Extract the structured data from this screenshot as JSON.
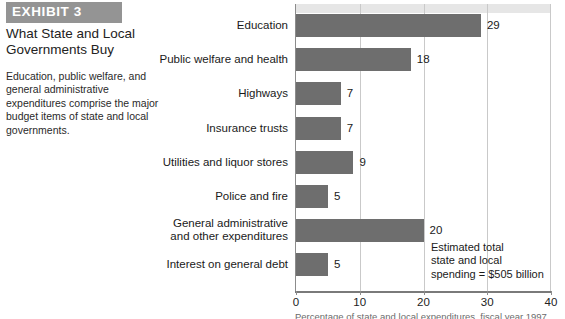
{
  "exhibit": {
    "banner_label": "EXHIBIT 3",
    "title": "What State and Local\nGovernments Buy",
    "description": "Education, public welfare, and general administrative expenditures comprise the major budget items of state and local governments."
  },
  "annotation": "Estimated total\nstate and local\nspending = $505 billion",
  "source_caption": "Percentage of state and local expenditures, fiscal year 1997",
  "colors": {
    "banner": "#949494",
    "bar_fill": "#6e6e6e",
    "gridline": "#c9c9c9",
    "axis": "#7a7a7a",
    "top_band": "#e6e6e6"
  },
  "chart_data": {
    "type": "bar",
    "orientation": "horizontal",
    "title": "What State and Local Governments Buy",
    "xlabel": "",
    "ylabel": "",
    "xlim": [
      0,
      40
    ],
    "xticks": [
      0,
      10,
      20,
      30,
      40
    ],
    "xtick_labels": [
      "0",
      "10",
      "20",
      "30",
      "40"
    ],
    "grid": true,
    "legend": "none",
    "categories": [
      "Education",
      "Public welfare and health",
      "Highways",
      "Insurance trusts",
      "Utilities and liquor stores",
      "Police and fire",
      "General administrative\nand other expenditures",
      "Interest on general debt"
    ],
    "values": [
      29,
      18,
      7,
      7,
      9,
      5,
      20,
      5
    ],
    "value_labels": [
      "29",
      "18",
      "7",
      "7",
      "9",
      "5",
      "20",
      "5"
    ],
    "annotations": [
      "Estimated total state and local spending = $505 billion"
    ]
  }
}
